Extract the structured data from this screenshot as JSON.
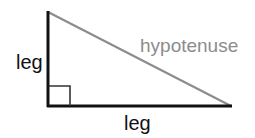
{
  "diagram": {
    "labels": {
      "left_leg": "leg",
      "bottom_leg": "leg",
      "hypotenuse": "hypotenuse"
    },
    "colors": {
      "legs": "#111111",
      "hypotenuse": "#8c8c8c",
      "right_angle_marker": "#333333",
      "leg_text": "#111111",
      "hypotenuse_text": "#8c8c8c"
    },
    "vertices": {
      "top": [
        48,
        12
      ],
      "right_angle": [
        48,
        106
      ],
      "right": [
        231,
        106
      ]
    }
  }
}
